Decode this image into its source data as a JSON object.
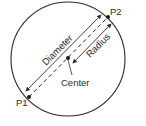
{
  "diagram": {
    "labels": {
      "p1": "P1",
      "p2": "P2",
      "diameter": "Diameter",
      "radius": "Radius",
      "center": "Center"
    },
    "colors": {
      "stroke": "#2a2a2a",
      "background": "#ffffff"
    }
  }
}
